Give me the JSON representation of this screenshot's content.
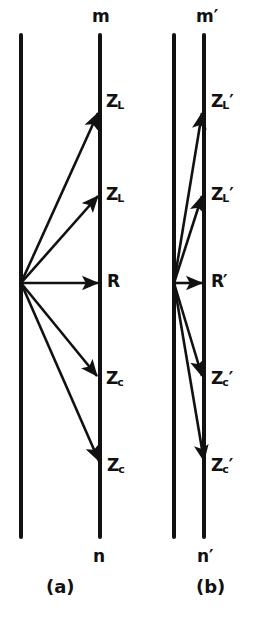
{
  "figure": {
    "background_color": "#ffffff",
    "stroke_color": "#111111",
    "width": 271,
    "height": 619
  },
  "panels": [
    {
      "id": "a",
      "caption": "(a)",
      "caption_x": 46,
      "caption_y": 578,
      "rail_left_x": 21,
      "rail_right_x": 100,
      "rail_top_y": 35,
      "rail_bottom_y": 537,
      "rail_width": 4,
      "origin_x": 21,
      "origin_y": 283,
      "top_label": "m",
      "top_label_x": 92,
      "top_label_y": 8,
      "bottom_label": "n",
      "bottom_label_x": 93,
      "bottom_label_y": 548,
      "vectors": [
        {
          "name": "ZL-upper",
          "base": "Z",
          "sub": "L",
          "prime": "",
          "tip_x": 98,
          "tip_y": 113,
          "label_x": 106,
          "label_y": 93
        },
        {
          "name": "ZL-lower",
          "base": "Z",
          "sub": "L",
          "prime": "",
          "tip_x": 98,
          "tip_y": 196,
          "label_x": 106,
          "label_y": 186
        },
        {
          "name": "R",
          "base": "R",
          "sub": "",
          "prime": "",
          "tip_x": 98,
          "tip_y": 283,
          "label_x": 107,
          "label_y": 273
        },
        {
          "name": "Zc-upper",
          "base": "Z",
          "sub": "c",
          "prime": "",
          "tip_x": 97,
          "tip_y": 376,
          "label_x": 106,
          "label_y": 370
        },
        {
          "name": "Zc-lower",
          "base": "Z",
          "sub": "c",
          "prime": "",
          "tip_x": 99,
          "tip_y": 461,
          "label_x": 107,
          "label_y": 457
        }
      ]
    },
    {
      "id": "b",
      "caption": "(b)",
      "caption_x": 196,
      "caption_y": 578,
      "rail_left_x": 174,
      "rail_right_x": 204,
      "rail_top_y": 35,
      "rail_bottom_y": 537,
      "rail_width": 4,
      "origin_x": 174,
      "origin_y": 283,
      "top_label": "m′",
      "top_label_x": 196,
      "top_label_y": 8,
      "bottom_label": "n′",
      "bottom_label_x": 197,
      "bottom_label_y": 548,
      "vectors": [
        {
          "name": "ZL-prime-upper",
          "base": "Z",
          "sub": "L",
          "prime": "′",
          "tip_x": 202,
          "tip_y": 113,
          "label_x": 211,
          "label_y": 93
        },
        {
          "name": "ZL-prime-lower",
          "base": "Z",
          "sub": "L",
          "prime": "′",
          "tip_x": 202,
          "tip_y": 196,
          "label_x": 211,
          "label_y": 186
        },
        {
          "name": "R-prime",
          "base": "R",
          "sub": "",
          "prime": "′",
          "tip_x": 202,
          "tip_y": 283,
          "label_x": 211,
          "label_y": 273
        },
        {
          "name": "Zc-prime-upper",
          "base": "Z",
          "sub": "c",
          "prime": "′",
          "tip_x": 202,
          "tip_y": 376,
          "label_x": 211,
          "label_y": 370
        },
        {
          "name": "Zc-prime-lower",
          "base": "Z",
          "sub": "c",
          "prime": "′",
          "tip_x": 204,
          "tip_y": 461,
          "label_x": 211,
          "label_y": 457
        }
      ]
    }
  ]
}
